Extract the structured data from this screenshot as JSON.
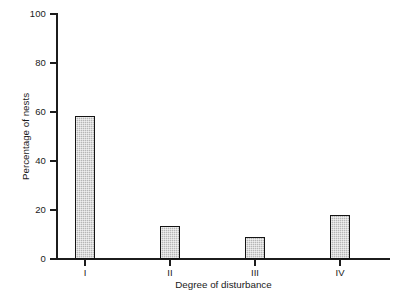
{
  "chart_data": {
    "type": "bar",
    "title": "",
    "subtitle": "",
    "xlabel": "Degree of disturbance",
    "ylabel": "Percentage of nests",
    "categories": [
      "I",
      "II",
      "III",
      "IV"
    ],
    "values": [
      58.5,
      13.5,
      9,
      18
    ],
    "ylim": [
      0,
      100
    ],
    "yticks": [
      0,
      20,
      40,
      60,
      80,
      100
    ],
    "ytick_labels": [
      "0",
      "20",
      "40",
      "60",
      "80",
      "100"
    ],
    "grid": false,
    "legend": null,
    "legend_position": "none",
    "annotations": [],
    "series": [
      {
        "name": "Percentage of nests",
        "values": [
          58.5,
          13.5,
          9,
          18
        ]
      }
    ],
    "bar_style": {
      "fill": "#b6b6b6",
      "edge": "#141414",
      "pattern": "dotted-hatch"
    }
  },
  "axis": {
    "y_title": "Percentage of nests",
    "x_title": "Degree of disturbance",
    "y_ticks": [
      {
        "label": "100",
        "value": 100
      },
      {
        "label": "80",
        "value": 80
      },
      {
        "label": "60",
        "value": 60
      },
      {
        "label": "40",
        "value": 40
      },
      {
        "label": "20",
        "value": 20
      },
      {
        "label": "0",
        "value": 0
      }
    ],
    "x_ticks": [
      {
        "label": "I",
        "value": 58.5
      },
      {
        "label": "II",
        "value": 13.5
      },
      {
        "label": "III",
        "value": 9
      },
      {
        "label": "IV",
        "value": 18
      }
    ]
  },
  "colors": {
    "bar_fill": "#b6b6b6",
    "bar_edge": "#141414",
    "axis": "#1c1c1c",
    "text": "#1a1a1a",
    "background": "#ffffff"
  }
}
